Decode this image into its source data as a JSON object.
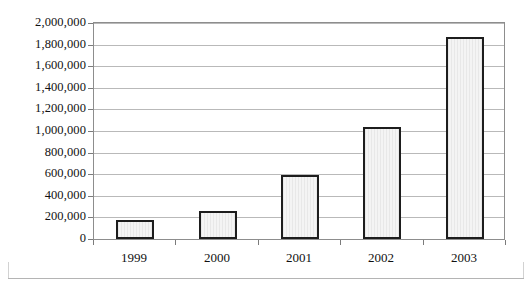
{
  "chart_data": {
    "type": "bar",
    "title": "",
    "xlabel": "",
    "ylabel": "",
    "categories": [
      "1999",
      "2000",
      "2001",
      "2002",
      "2003"
    ],
    "values": [
      180000,
      255000,
      595000,
      1035000,
      1870000
    ],
    "ylim": [
      0,
      2000000
    ],
    "ytick_values": [
      0,
      200000,
      400000,
      600000,
      800000,
      1000000,
      1200000,
      1400000,
      1600000,
      1800000,
      2000000
    ],
    "ytick_labels": [
      "0",
      "200,000",
      "400,000",
      "600,000",
      "800,000",
      "1,000,000",
      "1,200,000",
      "1,400,000",
      "1,600,000",
      "1,800,000",
      "2,000,000"
    ],
    "grid": true,
    "legend": null,
    "bar_fill_color": "#eeeeee",
    "bar_edge_color": "#1d1d1d",
    "gridline_color": "#b9b9b9",
    "plot_border_color": "#8d8d8d",
    "background_color": "#ffffff"
  }
}
